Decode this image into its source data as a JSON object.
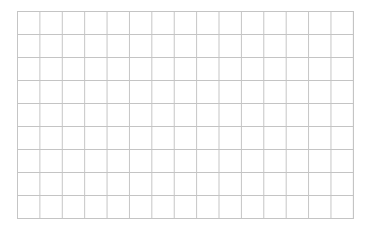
{
  "grid": {
    "columns": 15,
    "rows": 9,
    "line_color": "#c4c4c4",
    "background_color": "#ffffff"
  }
}
